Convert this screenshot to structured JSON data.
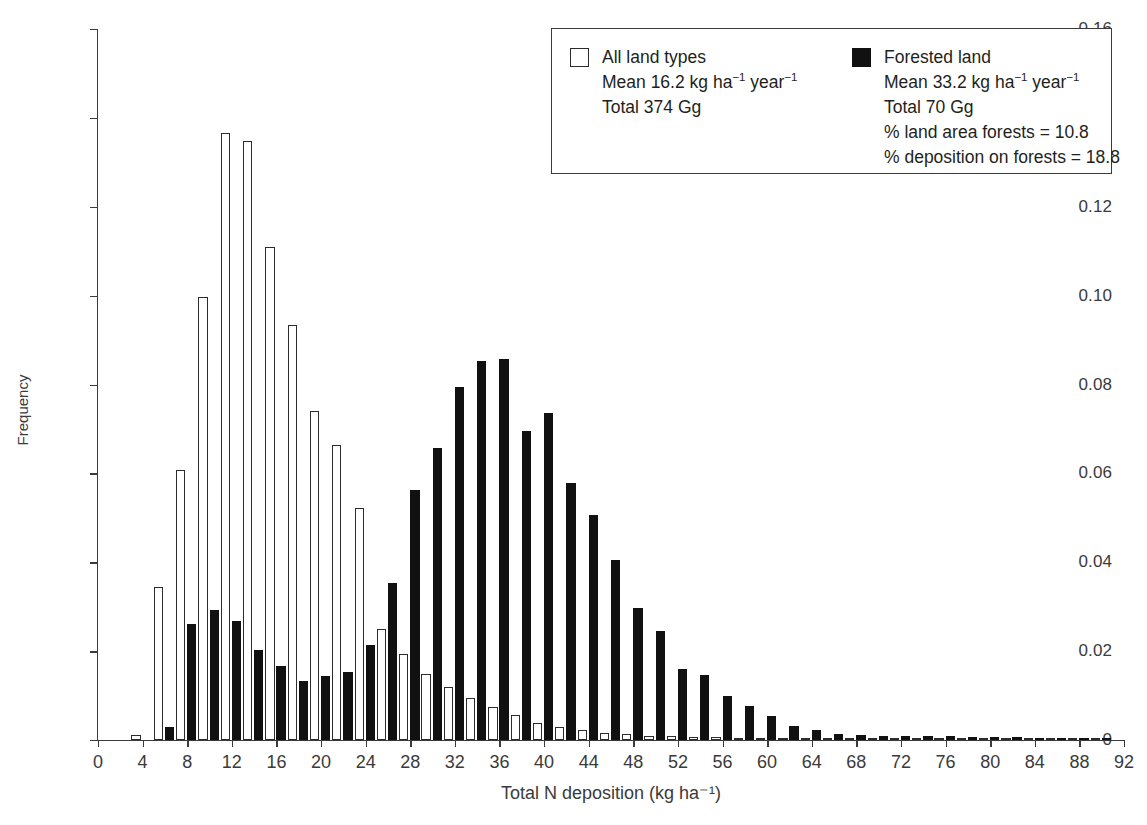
{
  "chart_data": {
    "type": "bar",
    "title": "",
    "xlabel": "Total N deposition (kg ha⁻¹)",
    "ylabel": "Frequency",
    "xlim": [
      0,
      92
    ],
    "ylim": [
      0,
      0.16
    ],
    "grid": false,
    "bin_width": 2,
    "legend_position": "top-right",
    "xticks": [
      0,
      4,
      8,
      12,
      16,
      20,
      24,
      28,
      32,
      36,
      40,
      44,
      48,
      52,
      56,
      60,
      64,
      68,
      72,
      76,
      80,
      84,
      88,
      92
    ],
    "yticks": [
      0,
      0.02,
      0.04,
      0.06,
      0.08,
      0.1,
      0.12,
      0.14,
      0.16
    ],
    "ytick_labels": [
      "0",
      "0.02",
      "0.04",
      "0.06",
      "0.08",
      "0.10",
      "0.12",
      "0.14",
      "0.16"
    ],
    "bin_centers": [
      4,
      6,
      8,
      10,
      12,
      14,
      16,
      18,
      20,
      22,
      24,
      26,
      28,
      30,
      32,
      34,
      36,
      38,
      40,
      42,
      44,
      46,
      48,
      50,
      52,
      54,
      56,
      58,
      60,
      62,
      64,
      66,
      68,
      70,
      72,
      74,
      76,
      78,
      80,
      82,
      84,
      86,
      88,
      90
    ],
    "series": [
      {
        "name": "All land types",
        "color": "#ffffff",
        "edge": "#2c2c2c",
        "values": [
          0.0012,
          0.0345,
          0.0607,
          0.0998,
          0.1365,
          0.1348,
          0.111,
          0.0933,
          0.074,
          0.0663,
          0.0521,
          0.025,
          0.0193,
          0.0148,
          0.0119,
          0.0094,
          0.0074,
          0.0056,
          0.0039,
          0.003,
          0.0022,
          0.0016,
          0.0013,
          0.001,
          0.0008,
          0.0007,
          0.0006,
          0.0005,
          0.0004,
          0.0004,
          0.0003,
          0.0003,
          0.0002,
          0.0002,
          0.0002,
          0.0002,
          0.0001,
          0.0001,
          0.0001,
          0.0001,
          0.0001,
          0.0001,
          0.0001,
          0.0001
        ]
      },
      {
        "name": "Forested land",
        "color": "#111111",
        "edge": "#111111",
        "values": [
          0.0,
          0.003,
          0.0262,
          0.0293,
          0.0267,
          0.0202,
          0.0167,
          0.0133,
          0.0144,
          0.0152,
          0.0213,
          0.0354,
          0.0563,
          0.0658,
          0.0795,
          0.0853,
          0.0858,
          0.0695,
          0.0736,
          0.0578,
          0.0506,
          0.0404,
          0.0296,
          0.0246,
          0.0159,
          0.0146,
          0.0098,
          0.0077,
          0.0053,
          0.0032,
          0.0023,
          0.0014,
          0.0012,
          0.001,
          0.0009,
          0.0008,
          0.0008,
          0.0007,
          0.0006,
          0.0006,
          0.0005,
          0.0005,
          0.0005,
          0.0005
        ]
      }
    ]
  },
  "legend": {
    "columns": [
      {
        "swatch": "open-square",
        "lines": [
          "All land types",
          "Mean 16.2 kg ha<sup>−1</sup> year<sup>−1</sup>",
          "Total 374 Gg"
        ]
      },
      {
        "swatch": "filled-square",
        "lines": [
          "Forested land",
          "Mean 33.2 kg ha<sup>−1</sup> year<sup>−1</sup>",
          "Total 70 Gg",
          "% land area forests = 10.8",
          "% deposition on forests = 18.8"
        ]
      }
    ]
  }
}
